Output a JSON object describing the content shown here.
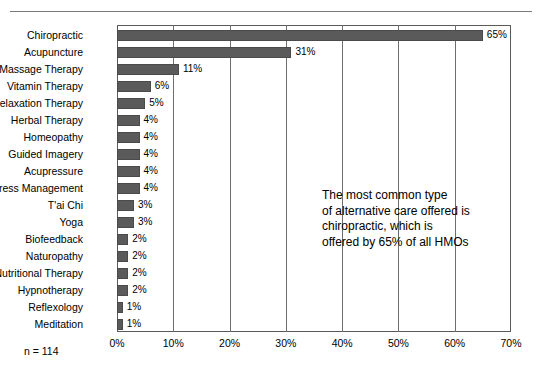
{
  "figure": {
    "sample_size_note": "n = 114",
    "annotation_lines": [
      "The most common type",
      "of alternative care offered is",
      "chiropractic, which is",
      "offered by 65% of all HMOs"
    ],
    "bar_color": "#5a5a5a",
    "frame_color": "#5a5a5a",
    "background": "#ffffff"
  },
  "chart_data": {
    "type": "bar",
    "orientation": "horizontal",
    "title": "",
    "subtitle": "",
    "xlabel": "",
    "ylabel": "",
    "xlim": [
      0,
      70
    ],
    "xtick_labels": [
      "0%",
      "10%",
      "20%",
      "30%",
      "40%",
      "50%",
      "60%",
      "70%"
    ],
    "xticks": [
      0,
      10,
      20,
      30,
      40,
      50,
      60,
      70
    ],
    "grid": true,
    "grid_axis": "x",
    "legend": false,
    "value_label_suffix": "%",
    "categories": [
      "Chiropractic",
      "Acupuncture",
      "Massage Therapy",
      "Vitamin Therapy",
      "Relaxation Therapy",
      "Herbal Therapy",
      "Homeopathy",
      "Guided Imagery",
      "Acupressure",
      "Stress Management",
      "T'ai Chi",
      "Yoga",
      "Biofeedback",
      "Naturopathy",
      "Nutritional Therapy",
      "Hypnotherapy",
      "Reflexology",
      "Meditation"
    ],
    "values": [
      65,
      31,
      11,
      6,
      5,
      4,
      4,
      4,
      4,
      4,
      3,
      3,
      2,
      2,
      2,
      2,
      1,
      1
    ],
    "value_labels": [
      "65%",
      "31%",
      "11%",
      "6%",
      "5%",
      "4%",
      "4%",
      "4%",
      "4%",
      "4%",
      "3%",
      "3%",
      "2%",
      "2%",
      "2%",
      "2%",
      "1%",
      "1%"
    ]
  }
}
